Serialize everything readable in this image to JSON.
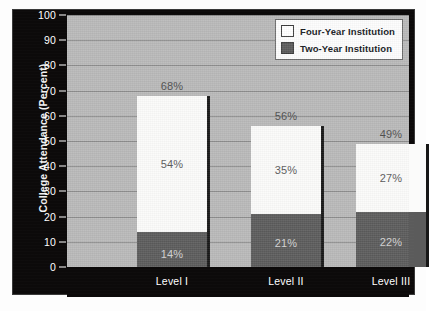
{
  "chart_data": {
    "type": "bar",
    "subtype": "stacked-bar",
    "title": "",
    "xlabel": "",
    "ylabel": "College Attendance (Percent)",
    "ylim": [
      0,
      100
    ],
    "yticks": [
      0,
      10,
      20,
      30,
      40,
      50,
      60,
      70,
      80,
      90,
      100
    ],
    "ytick_labels": [
      "0",
      "10",
      "20",
      "30",
      "40",
      "50",
      "60",
      "70",
      "80",
      "90",
      "100"
    ],
    "grid": true,
    "legend_position": "top-right",
    "categories": [
      "Level I",
      "Level II",
      "Level III"
    ],
    "series": [
      {
        "name": "Two-Year Institution",
        "color": "#5b5b5b",
        "values": [
          14,
          21,
          22
        ],
        "value_labels": [
          "14%",
          "21%",
          "22%"
        ]
      },
      {
        "name": "Four-Year Institution",
        "color": "#fbfbfa",
        "values": [
          54,
          35,
          27
        ],
        "value_labels": [
          "54%",
          "35%",
          "27%"
        ]
      }
    ],
    "totals": [
      68,
      56,
      49
    ],
    "total_labels": [
      "68%",
      "56%",
      "49%"
    ]
  },
  "legend": {
    "items": [
      {
        "label": "Four-Year Institution",
        "swatch": "white"
      },
      {
        "label": "Two-Year Institution",
        "swatch": "dark-gray"
      }
    ]
  },
  "colors": {
    "panel_background": "#0c0a0a",
    "plot_background": "#b9b9b9",
    "gridline": "#8d8d8d",
    "four_year": "#fbfbfa",
    "two_year": "#5b5b5b",
    "axis_text": "#ffffff",
    "label_text_on_white": "#5a5a5a",
    "label_text_on_dark": "#d2d2d2",
    "total_label_text": "#4e4e4e"
  }
}
